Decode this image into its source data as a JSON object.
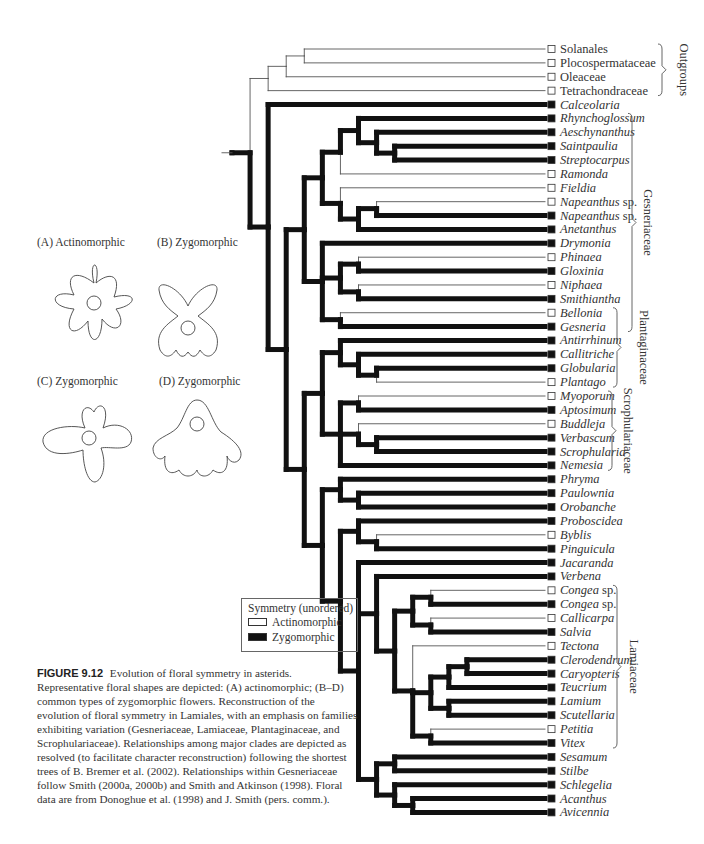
{
  "figure": {
    "number": "FIGURE 9.12",
    "caption": "Evolution of floral symmetry in asterids. Representative floral shapes are depicted: (A) actinomorphic; (B–D) common types of zygomorphic flowers. Reconstruction of the evolution of floral symmetry in Lamiales, with an emphasis on families exhibiting variation (Gesneriaceae, Lamiaceae, Plantaginaceae, and Scrophulariaceae). Relationships among major clades are depicted as resolved (to facilitate character reconstruction) following the shortest trees of B. Bremer et al. (2002). Relationships within Gesneriaceae follow Smith (2000a, 2000b) and Smith and Atkinson (1998). Floral data are from Donoghue et al. (1998) and J. Smith (pers. comm.)."
  },
  "flowers": [
    {
      "label": "(A)  Actinomorphic",
      "type": "actinomorphic"
    },
    {
      "label": "(B)  Zygomorphic",
      "type": "zygomorphic"
    },
    {
      "label": "(C)  Zygomorphic",
      "type": "zygomorphic"
    },
    {
      "label": "(D)  Zygomorphic",
      "type": "zygomorphic"
    }
  ],
  "legend": {
    "title": "Symmetry (unordered)",
    "items": [
      {
        "label": "Actinomorphic",
        "state": "open",
        "color": "#ffffff"
      },
      {
        "label": "Zygomorphic",
        "state": "filled",
        "color": "#111111"
      }
    ]
  },
  "taxa": [
    {
      "name": "Solanales",
      "state": "A",
      "italic": false
    },
    {
      "name": "Plocospermataceae",
      "state": "A",
      "italic": false
    },
    {
      "name": "Oleaceae",
      "state": "A",
      "italic": false
    },
    {
      "name": "Tetrachondraceae",
      "state": "A",
      "italic": false
    },
    {
      "name": "Calceolaria",
      "state": "Z",
      "italic": true
    },
    {
      "name": "Rhynchoglossum",
      "state": "Z",
      "italic": true
    },
    {
      "name": "Aeschynanthus",
      "state": "Z",
      "italic": true
    },
    {
      "name": "Saintpaulia",
      "state": "Z",
      "italic": true
    },
    {
      "name": "Streptocarpus",
      "state": "Z",
      "italic": true
    },
    {
      "name": "Ramonda",
      "state": "A",
      "italic": true
    },
    {
      "name": "Fieldia",
      "state": "A",
      "italic": true
    },
    {
      "name": "Napeanthus",
      "suffix": " sp.",
      "state": "A",
      "italic": true
    },
    {
      "name": "Napeanthus",
      "suffix": " sp.",
      "state": "Z",
      "italic": true
    },
    {
      "name": "Anetanthus",
      "state": "Z",
      "italic": true
    },
    {
      "name": "Drymonia",
      "state": "Z",
      "italic": true
    },
    {
      "name": "Phinaea",
      "state": "A",
      "italic": true
    },
    {
      "name": "Gloxinia",
      "state": "Z",
      "italic": true
    },
    {
      "name": "Niphaea",
      "state": "A",
      "italic": true
    },
    {
      "name": "Smithiantha",
      "state": "Z",
      "italic": true
    },
    {
      "name": "Bellonia",
      "state": "A",
      "italic": true
    },
    {
      "name": "Gesneria",
      "state": "Z",
      "italic": true
    },
    {
      "name": "Antirrhinum",
      "state": "Z",
      "italic": true
    },
    {
      "name": "Callitriche",
      "state": "Z",
      "italic": true
    },
    {
      "name": "Globularia",
      "state": "Z",
      "italic": true
    },
    {
      "name": "Plantago",
      "state": "A",
      "italic": true
    },
    {
      "name": "Myoporum",
      "state": "A",
      "italic": true
    },
    {
      "name": "Aptosimum",
      "state": "Z",
      "italic": true
    },
    {
      "name": "Buddleja",
      "state": "A",
      "italic": true
    },
    {
      "name": "Verbascum",
      "state": "Z",
      "italic": true
    },
    {
      "name": "Scrophularia",
      "state": "Z",
      "italic": true
    },
    {
      "name": "Nemesia",
      "state": "Z",
      "italic": true
    },
    {
      "name": "Phryma",
      "state": "Z",
      "italic": true
    },
    {
      "name": "Paulownia",
      "state": "Z",
      "italic": true
    },
    {
      "name": "Orobanche",
      "state": "Z",
      "italic": true
    },
    {
      "name": "Proboscidea",
      "state": "Z",
      "italic": true
    },
    {
      "name": "Byblis",
      "state": "A",
      "italic": true
    },
    {
      "name": "Pinguicula",
      "state": "Z",
      "italic": true
    },
    {
      "name": "Jacaranda",
      "state": "Z",
      "italic": true
    },
    {
      "name": "Verbena",
      "state": "Z",
      "italic": true
    },
    {
      "name": "Congea",
      "suffix": " sp.",
      "state": "A",
      "italic": true
    },
    {
      "name": "Congea",
      "suffix": " sp.",
      "state": "Z",
      "italic": true
    },
    {
      "name": "Callicarpa",
      "state": "A",
      "italic": true
    },
    {
      "name": "Salvia",
      "state": "Z",
      "italic": true
    },
    {
      "name": "Tectona",
      "state": "A",
      "italic": true
    },
    {
      "name": "Clerodendrum",
      "state": "Z",
      "italic": true
    },
    {
      "name": "Caryopteris",
      "state": "Z",
      "italic": true
    },
    {
      "name": "Teucrium",
      "state": "Z",
      "italic": true
    },
    {
      "name": "Lamium",
      "state": "Z",
      "italic": true
    },
    {
      "name": "Scutellaria",
      "state": "Z",
      "italic": true
    },
    {
      "name": "Petitia",
      "state": "A",
      "italic": true
    },
    {
      "name": "Vitex",
      "state": "Z",
      "italic": true
    },
    {
      "name": "Sesamum",
      "state": "Z",
      "italic": true
    },
    {
      "name": "Stilbe",
      "state": "Z",
      "italic": true
    },
    {
      "name": "Schlegelia",
      "state": "Z",
      "italic": true
    },
    {
      "name": "Acanthus",
      "state": "Z",
      "italic": true
    },
    {
      "name": "Avicennia",
      "state": "Z",
      "italic": true
    }
  ],
  "groups": [
    {
      "label": "Outgroups",
      "from": 0,
      "to": 3
    },
    {
      "label": "Gesneriaceae",
      "from": 5,
      "to": 20
    },
    {
      "label": "Plantaginaceae",
      "from": 19,
      "to": 24
    },
    {
      "label": "Scrophulariaceae",
      "from": 25,
      "to": 30
    },
    {
      "label": "Lamiaceae",
      "from": 39,
      "to": 50
    }
  ],
  "tree": {
    "newick": "(((((Solanales,Plocospermataceae),Oleaceae),Tetrachondraceae),(Calceolaria,(((((Rhynchoglossum,(Aeschynanthus,(Saintpaulia,Streptocarpus))),Ramonda),(Fieldia,((Napeanthus_A,Napeanthus_Z),Anetanthus))),(Drymonia,((Phinaea,Gloxinia),(Niphaea,Smithiantha)),(Bellonia,Gesneria))),(((Antirrhinum,(Callitriche,(Globularia,Plantago))),((Myoporum,Aptosimum),(Buddleja,(Verbascum,Scrophularia)),Nemesia)),((Phryma,(Paulownia,Orobanche)),((Proboscidea,(Byblis,Pinguicula)),(Jacaranda,(Verbena,(((Congea_A,Congea_Z),(Callicarpa,Salvia)),(Tectona,(((Clerodendrum,Caryopteris),Teucrium),(Lamium,Scutellaria)),(Petitia,Vitex)))),((Sesamum,Stilbe),(Schlegelia,(Acanthus,Avicennia)))))))))))"
  }
}
